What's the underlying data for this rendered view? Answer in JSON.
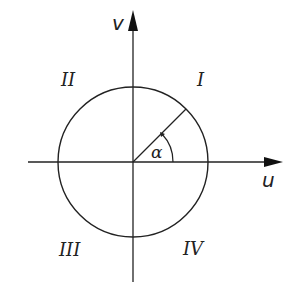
{
  "diagram": {
    "type": "unit circle in u-v plane",
    "axes": {
      "horizontal_label": "u",
      "vertical_label": "v"
    },
    "quadrants": {
      "q1": "I",
      "q2": "II",
      "q3": "III",
      "q4": "IV"
    },
    "angle_label": "α",
    "colors": {
      "line": "#222222",
      "background": "#ffffff"
    }
  }
}
